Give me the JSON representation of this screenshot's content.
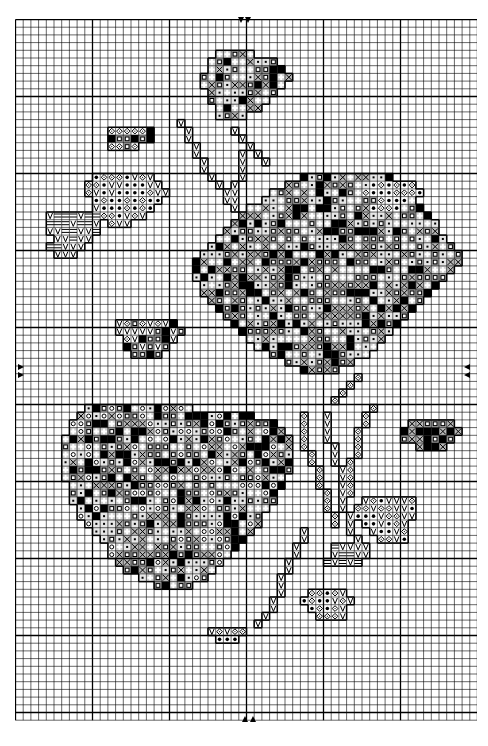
{
  "chart_data": {
    "type": "cross-stitch-pattern",
    "title": "",
    "grid": {
      "cols": 60,
      "rows": 91,
      "cell_px": 7.7,
      "bold_every": 10,
      "origin_px": [
        15,
        19
      ]
    },
    "center_markers": {
      "top": {
        "x_px": [
          241,
          248
        ],
        "y_px": 20,
        "direction": "down"
      },
      "bottom": {
        "x_px": [
          245,
          253
        ],
        "y_px": 716,
        "direction": "up"
      },
      "left": {
        "x_px": 18,
        "y_px": [
          367,
          374
        ],
        "direction": "right"
      },
      "right": {
        "x_px": 466,
        "y_px": [
          367,
          374
        ],
        "direction": "left"
      }
    },
    "symbols": [
      {
        "key": "filled-square",
        "shade": "#000000"
      },
      {
        "key": "square-in-square",
        "shade": "#9a9a9a"
      },
      {
        "key": "cross-x",
        "shade": "#b8b8b8"
      },
      {
        "key": "plus-cross",
        "shade": "#d0d0d0"
      },
      {
        "key": "dot",
        "shade": "#e6e6e6"
      },
      {
        "key": "v-check",
        "shade": "#ffffff"
      },
      {
        "key": "diamond-dot",
        "shade": "#ffffff"
      },
      {
        "key": "star-dot",
        "shade": "#ffffff"
      },
      {
        "key": "dash-lines",
        "shade": "#ffffff"
      },
      {
        "key": "circle",
        "shade": "#ffffff"
      }
    ],
    "regions": [
      {
        "name": "top-bud",
        "rows": [
          [
            4,
            26,
            30
          ],
          [
            5,
            25,
            33
          ],
          [
            6,
            25,
            34
          ],
          [
            7,
            24,
            35
          ],
          [
            8,
            24,
            34
          ],
          [
            9,
            25,
            33
          ],
          [
            10,
            25,
            32
          ],
          [
            11,
            26,
            31
          ],
          [
            12,
            26,
            29
          ]
        ],
        "fill": [
          "square-in-square",
          "cross-x",
          "plus-cross",
          "dot",
          "filled-square"
        ]
      },
      {
        "name": "left-bud",
        "rows": [
          [
            14,
            12,
            17
          ],
          [
            15,
            12,
            17
          ],
          [
            16,
            12,
            15
          ]
        ],
        "fill": [
          "square-in-square",
          "filled-square",
          "diamond-dot"
        ]
      },
      {
        "name": "left-leaf",
        "rows": [
          [
            20,
            10,
            17
          ],
          [
            21,
            9,
            18
          ],
          [
            22,
            9,
            19
          ],
          [
            23,
            10,
            18
          ],
          [
            24,
            10,
            17
          ],
          [
            25,
            11,
            16
          ],
          [
            26,
            12,
            14
          ]
        ],
        "fill": [
          "star-dot",
          "diamond-dot",
          "v-check"
        ]
      },
      {
        "name": "left-leaf-lines",
        "rows": [
          [
            25,
            4,
            10
          ],
          [
            26,
            4,
            10
          ],
          [
            27,
            4,
            10
          ],
          [
            28,
            5,
            9
          ],
          [
            29,
            4,
            8
          ],
          [
            30,
            5,
            7
          ]
        ],
        "fill": [
          "dash-lines",
          "v-check"
        ]
      },
      {
        "name": "right-upper-rose",
        "rows": [
          [
            20,
            37,
            48
          ],
          [
            21,
            35,
            50
          ],
          [
            22,
            33,
            51
          ],
          [
            23,
            32,
            51
          ],
          [
            24,
            30,
            52
          ],
          [
            25,
            29,
            53
          ],
          [
            26,
            28,
            54
          ],
          [
            27,
            27,
            54
          ],
          [
            28,
            26,
            55
          ],
          [
            29,
            25,
            56
          ],
          [
            30,
            24,
            57
          ],
          [
            31,
            23,
            57
          ],
          [
            32,
            23,
            56
          ],
          [
            33,
            23,
            55
          ],
          [
            34,
            24,
            54
          ],
          [
            35,
            24,
            53
          ],
          [
            36,
            25,
            52
          ],
          [
            37,
            26,
            51
          ],
          [
            38,
            27,
            50
          ],
          [
            39,
            28,
            49
          ],
          [
            40,
            29,
            48
          ],
          [
            41,
            30,
            47
          ],
          [
            42,
            31,
            46
          ],
          [
            43,
            33,
            45
          ],
          [
            44,
            35,
            43
          ],
          [
            45,
            37,
            41
          ]
        ],
        "fill": [
          "square-in-square",
          "plus-cross",
          "dot",
          "cross-x",
          "filled-square"
        ]
      },
      {
        "name": "right-leaf-top",
        "rows": [
          [
            21,
            46,
            51
          ],
          [
            22,
            45,
            52
          ],
          [
            23,
            47,
            50
          ],
          [
            24,
            46,
            49
          ]
        ],
        "fill": [
          "star-dot",
          "diamond-dot"
        ]
      },
      {
        "name": "mid-left-cluster",
        "rows": [
          [
            39,
            13,
            20
          ],
          [
            40,
            13,
            21
          ],
          [
            41,
            14,
            20
          ],
          [
            42,
            14,
            19
          ],
          [
            43,
            15,
            18
          ]
        ],
        "fill": [
          "square-in-square",
          "diamond-dot",
          "filled-square",
          "v-check"
        ]
      },
      {
        "name": "lower-left-rose",
        "rows": [
          [
            50,
            9,
            22
          ],
          [
            51,
            8,
            30
          ],
          [
            52,
            7,
            33
          ],
          [
            53,
            7,
            34
          ],
          [
            54,
            6,
            35
          ],
          [
            55,
            6,
            35
          ],
          [
            56,
            6,
            35
          ],
          [
            57,
            6,
            35
          ],
          [
            58,
            6,
            35
          ],
          [
            59,
            6,
            34
          ],
          [
            60,
            7,
            34
          ],
          [
            61,
            7,
            33
          ],
          [
            62,
            7,
            33
          ],
          [
            63,
            8,
            32
          ],
          [
            64,
            8,
            31
          ],
          [
            65,
            9,
            31
          ],
          [
            66,
            10,
            30
          ],
          [
            67,
            11,
            29
          ],
          [
            68,
            12,
            28
          ],
          [
            69,
            12,
            27
          ],
          [
            70,
            13,
            26
          ],
          [
            71,
            14,
            25
          ],
          [
            72,
            16,
            24
          ],
          [
            73,
            18,
            22
          ]
        ],
        "fill": [
          "square-in-square",
          "plus-cross",
          "dot",
          "cross-x",
          "filled-square",
          "circle"
        ]
      },
      {
        "name": "right-bud",
        "rows": [
          [
            52,
            51,
            56
          ],
          [
            53,
            50,
            57
          ],
          [
            54,
            50,
            56
          ],
          [
            55,
            52,
            55
          ]
        ],
        "fill": [
          "square-in-square",
          "filled-square",
          "cross-x"
        ]
      },
      {
        "name": "lower-right-leaf",
        "rows": [
          [
            62,
            45,
            51
          ],
          [
            63,
            44,
            51
          ],
          [
            64,
            44,
            51
          ],
          [
            65,
            45,
            50
          ],
          [
            66,
            46,
            50
          ],
          [
            67,
            47,
            50
          ]
        ],
        "fill": [
          "star-dot",
          "diamond-dot",
          "v-check"
        ]
      },
      {
        "name": "lower-right-lines",
        "rows": [
          [
            68,
            41,
            45
          ],
          [
            69,
            41,
            45
          ],
          [
            70,
            40,
            44
          ]
        ],
        "fill": [
          "dash-lines",
          "v-check"
        ]
      },
      {
        "name": "bottom-leaf",
        "rows": [
          [
            74,
            38,
            42
          ],
          [
            75,
            37,
            43
          ],
          [
            76,
            38,
            42
          ],
          [
            77,
            39,
            42
          ]
        ],
        "fill": [
          "star-dot",
          "diamond-dot",
          "v-check"
        ]
      },
      {
        "name": "bottom-stem-base",
        "rows": [
          [
            79,
            25,
            29
          ],
          [
            80,
            26,
            28
          ]
        ],
        "fill": [
          "star-dot",
          "diamond-dot",
          "v-check"
        ]
      }
    ],
    "stems": [
      {
        "name": "stem-1",
        "cells": [
          [
            13,
            21
          ],
          [
            14,
            22
          ],
          [
            15,
            22
          ],
          [
            16,
            23
          ],
          [
            17,
            23
          ],
          [
            18,
            24
          ],
          [
            19,
            24
          ],
          [
            20,
            25
          ],
          [
            21,
            26
          ],
          [
            22,
            27
          ],
          [
            23,
            27
          ],
          [
            24,
            28
          ]
        ],
        "symbol": "v-check"
      },
      {
        "name": "stem-2",
        "cells": [
          [
            17,
            29
          ],
          [
            18,
            29
          ],
          [
            19,
            29
          ],
          [
            20,
            29
          ],
          [
            21,
            28
          ],
          [
            22,
            28
          ],
          [
            23,
            28
          ]
        ],
        "symbol": "v-check"
      },
      {
        "name": "stem-3",
        "cells": [
          [
            14,
            28
          ],
          [
            15,
            29
          ],
          [
            16,
            30
          ],
          [
            17,
            31
          ],
          [
            18,
            32
          ]
        ],
        "symbol": "v-check"
      },
      {
        "name": "stem-4",
        "cells": [
          [
            51,
            37
          ],
          [
            52,
            37
          ],
          [
            53,
            37
          ],
          [
            54,
            37
          ],
          [
            55,
            37
          ],
          [
            56,
            38
          ],
          [
            57,
            38
          ],
          [
            58,
            39
          ],
          [
            59,
            39
          ],
          [
            60,
            39
          ],
          [
            61,
            40
          ],
          [
            62,
            40
          ],
          [
            63,
            40
          ],
          [
            64,
            41
          ],
          [
            65,
            41
          ]
        ],
        "symbol": "diamond-dot"
      },
      {
        "name": "stem-5",
        "cells": [
          [
            51,
            40
          ],
          [
            52,
            40
          ],
          [
            53,
            40
          ],
          [
            54,
            40
          ],
          [
            55,
            41
          ],
          [
            56,
            41
          ],
          [
            57,
            41
          ],
          [
            58,
            42
          ],
          [
            59,
            42
          ],
          [
            60,
            42
          ],
          [
            61,
            42
          ],
          [
            62,
            42
          ],
          [
            63,
            42
          ],
          [
            64,
            43
          ],
          [
            65,
            43
          ],
          [
            66,
            43
          ],
          [
            67,
            44
          ],
          [
            68,
            44
          ]
        ],
        "symbol": "v-check"
      },
      {
        "name": "stem-6",
        "cells": [
          [
            50,
            46
          ],
          [
            51,
            45
          ],
          [
            52,
            45
          ],
          [
            53,
            44
          ],
          [
            54,
            44
          ],
          [
            55,
            44
          ],
          [
            56,
            44
          ],
          [
            57,
            43
          ],
          [
            58,
            43
          ],
          [
            59,
            43
          ],
          [
            60,
            43
          ],
          [
            61,
            43
          ]
        ],
        "symbol": "diamond-dot"
      },
      {
        "name": "stem-7",
        "cells": [
          [
            66,
            37
          ],
          [
            67,
            37
          ],
          [
            68,
            36
          ],
          [
            69,
            36
          ],
          [
            70,
            35
          ],
          [
            71,
            35
          ],
          [
            72,
            34
          ],
          [
            73,
            34
          ],
          [
            74,
            34
          ],
          [
            75,
            33
          ],
          [
            76,
            33
          ],
          [
            77,
            32
          ],
          [
            78,
            31
          ]
        ],
        "symbol": "v-check"
      },
      {
        "name": "stem-8",
        "cells": [
          [
            46,
            44
          ],
          [
            47,
            43
          ],
          [
            48,
            42
          ],
          [
            49,
            41
          ]
        ],
        "symbol": "diamond-dot"
      }
    ]
  }
}
